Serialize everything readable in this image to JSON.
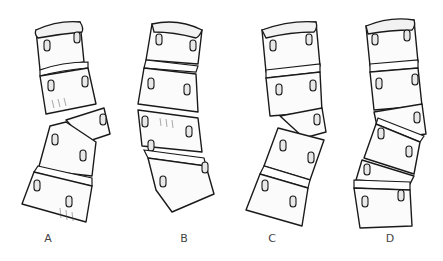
{
  "figure": {
    "type": "anatomical line illustration",
    "background": "#ffffff",
    "line_color": "#1a1a1a",
    "panels": [
      {
        "id": "A",
        "label": "A",
        "vertebrae_count": 5,
        "description": "upper two vertebrae separated from lower group by wedge-shaped displaced vertebra"
      },
      {
        "id": "B",
        "label": "B",
        "vertebrae_count": 4,
        "description": "continuous gently curved column"
      },
      {
        "id": "C",
        "label": "C",
        "vertebrae_count": 5,
        "description": "upper group angled, wedge vertebra at middle, lower two tilted"
      },
      {
        "id": "D",
        "label": "D",
        "vertebrae_count": 5,
        "description": "continuous column with alternating tilted segments"
      }
    ]
  }
}
